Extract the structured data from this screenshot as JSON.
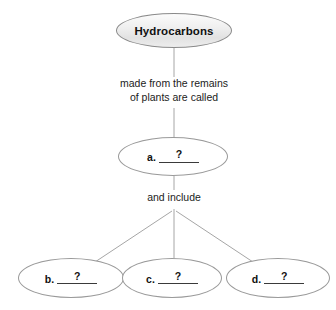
{
  "diagram": {
    "title_node": {
      "label": "Hydrocarbons"
    },
    "captions": {
      "from_remains": "made from the remains\nof plants are called",
      "and_include": "and include"
    },
    "blanks": [
      {
        "letter": "a.",
        "value": "?"
      },
      {
        "letter": "b.",
        "value": "?"
      },
      {
        "letter": "c.",
        "value": "?"
      },
      {
        "letter": "d.",
        "value": "?"
      }
    ],
    "colors": {
      "background": "#ffffff",
      "connector": "#a6a6a6",
      "root_border": "#8a8a8a",
      "node_border": "#9a9a9a",
      "text": "#111111"
    }
  }
}
